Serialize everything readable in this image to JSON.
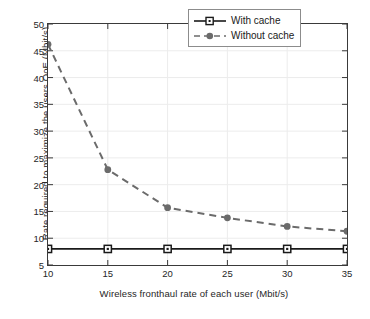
{
  "chart_data": {
    "type": "line",
    "title": "",
    "xlabel": "Wireless fronthaul rate of each user (Mbit/s)",
    "ylabel": "Rate required to maximize the users QoE (Mbit/s)",
    "x": [
      10,
      15,
      20,
      25,
      30,
      35
    ],
    "xlim": [
      10,
      35
    ],
    "ylim": [
      5,
      50
    ],
    "xticks": [
      10,
      15,
      20,
      25,
      30,
      35
    ],
    "yticks": [
      5,
      10,
      15,
      20,
      25,
      30,
      35,
      40,
      45,
      50
    ],
    "grid": true,
    "legend_position": "top-right",
    "series": [
      {
        "name": "With cache",
        "values": [
          8,
          8,
          8,
          8,
          8,
          8
        ],
        "color": "#1a1a1a",
        "line_style": "solid",
        "marker": "square"
      },
      {
        "name": "Without cache",
        "values": [
          46.2,
          22.8,
          15.7,
          13.8,
          12.2,
          11.3
        ],
        "color": "#6b6b6b",
        "line_style": "dashed",
        "marker": "circle"
      }
    ]
  },
  "axes": {
    "x_tick_labels": [
      "10",
      "15",
      "20",
      "25",
      "30",
      "35"
    ],
    "y_tick_labels": [
      "5",
      "10",
      "15",
      "20",
      "25",
      "30",
      "35",
      "40",
      "45",
      "50"
    ],
    "x_axis_label": "Wireless fronthaul rate of each user (Mbit/s)",
    "y_axis_label": "Rate required to maximize the users QoE (Mbit/s)"
  },
  "legend": {
    "items": [
      {
        "label": "With cache"
      },
      {
        "label": "Without cache"
      }
    ]
  }
}
